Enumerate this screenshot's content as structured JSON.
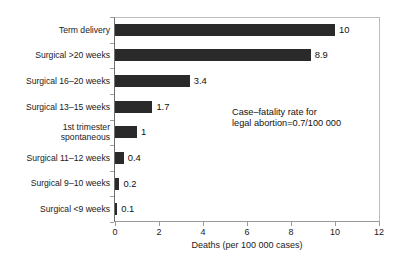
{
  "caption_remnant": "Figure: comparative mortality associated with pregnancy outcomes, per 100 000 cases",
  "chart_data": {
    "type": "bar",
    "orientation": "horizontal",
    "title": "",
    "categories": [
      "Term delivery",
      "Surgical >20 weeks",
      "Surgical 16–20 weeks",
      "Surgical 13–15 weeks",
      "1st trimester spontaneous",
      "Surgical 11–12 weeks",
      "Surgical 9–10 weeks",
      "Surgical <9 weeks"
    ],
    "category_lines": [
      [
        "Term delivery"
      ],
      [
        "Surgical >20 weeks"
      ],
      [
        "Surgical 16–20 weeks"
      ],
      [
        "Surgical 13–15 weeks"
      ],
      [
        "1st trimester",
        "spontaneous"
      ],
      [
        "Surgical 11–12 weeks"
      ],
      [
        "Surgical 9–10 weeks"
      ],
      [
        "Surgical <9 weeks"
      ]
    ],
    "values": [
      10,
      8.9,
      3.4,
      1.7,
      1,
      0.4,
      0.2,
      0.1
    ],
    "value_labels": [
      "10",
      "8.9",
      "3.4",
      "1.7",
      "1",
      "0.4",
      "0.2",
      "0.1"
    ],
    "xlabel": "Deaths (per 100 000 cases)",
    "ylabel": "",
    "xlim": [
      0,
      12
    ],
    "xticks": [
      0,
      2,
      4,
      6,
      8,
      10,
      12
    ],
    "xtick_labels": [
      "0",
      "2",
      "4",
      "6",
      "8",
      "10",
      "12"
    ],
    "grid": false,
    "legend": null,
    "bar_color": "#2a2a2a",
    "annotations": [
      {
        "lines": [
          "Case–fatality rate for",
          "legal abortion=0.7/100 000"
        ]
      }
    ]
  }
}
